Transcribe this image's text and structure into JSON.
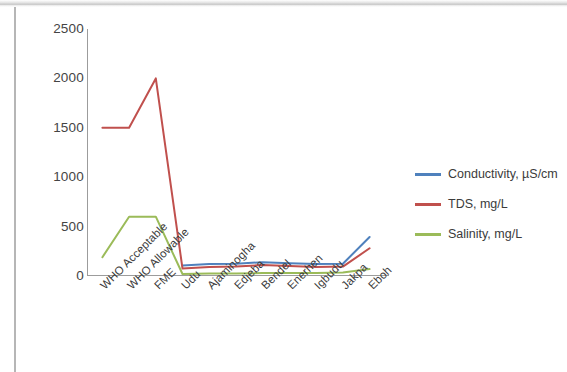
{
  "chart_data": {
    "type": "line",
    "title": "",
    "xlabel": "",
    "ylabel": "",
    "ylim": [
      0,
      2500
    ],
    "y_ticks": [
      0,
      500,
      1000,
      1500,
      2000,
      2500
    ],
    "grid": false,
    "legend_position": "right",
    "categories": [
      "WHO Acceptable",
      "WHO Allowable",
      "FME",
      "Udu",
      "Ajaminogha",
      "Edjeba",
      "Bendel",
      "Enerhen",
      "Igbudu",
      "Jakpa",
      "Eboh"
    ],
    "series": [
      {
        "name": "Conductivity, µS/cm",
        "color": "#4F81BD",
        "values": [
          null,
          null,
          null,
          105,
          120,
          125,
          140,
          130,
          120,
          125,
          395
        ]
      },
      {
        "name": "TDS, mg/L",
        "color": "#C0504D",
        "values": [
          1500,
          1500,
          2000,
          75,
          90,
          95,
          110,
          100,
          90,
          95,
          280
        ]
      },
      {
        "name": "Salinity, mg/L",
        "color": "#9BBB59",
        "values": [
          190,
          600,
          600,
          20,
          25,
          25,
          30,
          30,
          30,
          35,
          70
        ]
      }
    ]
  },
  "legend": {
    "items": [
      {
        "label": "Conductivity, µS/cm",
        "color": "#4F81BD"
      },
      {
        "label": "TDS, mg/L",
        "color": "#C0504D"
      },
      {
        "label": "Salinity, mg/L",
        "color": "#9BBB59"
      }
    ]
  },
  "axis": {
    "y_labels": [
      "2500",
      "2000",
      "1500",
      "1000",
      "500",
      "0"
    ],
    "x_labels": [
      "WHO Acceptable",
      "WHO Allowable",
      "FME",
      "Udu",
      "Ajaminogha",
      "Edjeba",
      "Bendel",
      "Enerhen",
      "Igbudu",
      "Jakpa",
      "Eboh"
    ]
  }
}
